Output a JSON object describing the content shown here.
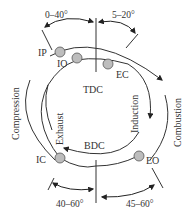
{
  "diagram": {
    "center_labels": {
      "top": "TDC",
      "bottom": "BDC"
    },
    "strokes": {
      "outer": "Compression",
      "outer_right": "Combustion",
      "inner_left": "Exhaust",
      "inner_right": "Induction"
    },
    "points": [
      {
        "id": "IP",
        "label": "IP"
      },
      {
        "id": "IO",
        "label": "IO"
      },
      {
        "id": "EC",
        "label": "EC"
      },
      {
        "id": "IC",
        "label": "IC"
      },
      {
        "id": "EO",
        "label": "EO"
      }
    ],
    "angles": {
      "top_left": "0–40°",
      "top_right": "5–20°",
      "bottom_left": "40–60°",
      "bottom_right": "45–60°"
    },
    "colors": {
      "line": "#333333",
      "marker_fill": "#bdbdbd",
      "marker_stroke": "#555555"
    }
  }
}
